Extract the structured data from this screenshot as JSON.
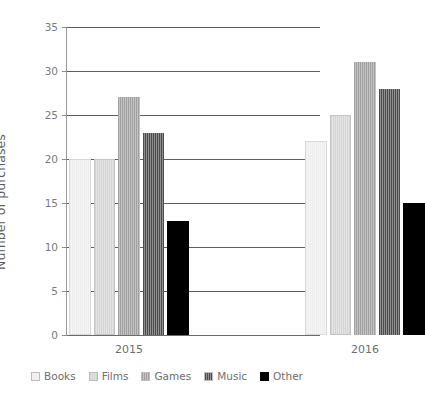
{
  "chart_data": {
    "type": "bar",
    "title": "",
    "xlabel": "",
    "ylabel": "Number of purchases",
    "categories": [
      "2015",
      "2016"
    ],
    "series": [
      {
        "name": "Books",
        "values": [
          20,
          22
        ],
        "color": "#eeeeee"
      },
      {
        "name": "Films",
        "values": [
          20,
          25
        ],
        "color": "#d4d4d4"
      },
      {
        "name": "Games",
        "values": [
          27,
          31
        ],
        "color": "#a0a0a0"
      },
      {
        "name": "Music",
        "values": [
          23,
          28
        ],
        "color": "#4c4c4c"
      },
      {
        "name": "Other",
        "values": [
          13,
          15
        ],
        "color": "#000000"
      }
    ],
    "ylim": [
      0,
      35
    ],
    "ytick_values": [
      0,
      5,
      10,
      15,
      20,
      25,
      30,
      35
    ],
    "ytick_labels": [
      "0",
      "5",
      "10",
      "15",
      "20",
      "25",
      "30",
      "35"
    ],
    "grid": true,
    "legend_position": "bottom",
    "annotations": []
  },
  "axis": {
    "y_title": "Number of purchases"
  },
  "legend": {
    "items": [
      {
        "label": "Books"
      },
      {
        "label": "Films"
      },
      {
        "label": "Games"
      },
      {
        "label": "Music"
      },
      {
        "label": "Other"
      }
    ]
  },
  "style": {
    "grid_color": "#5e5e5e",
    "axis_color": "#9a9a9a",
    "text_color": "#6e6e6e",
    "background": "#ffffff"
  }
}
